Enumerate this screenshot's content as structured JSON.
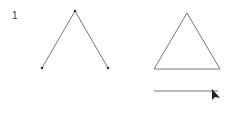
{
  "step_label": "1",
  "colors": {
    "stroke": "#777777",
    "point": "#333333",
    "cursor": "#222222"
  },
  "open_shape": {
    "points": [
      [
        42,
        68
      ],
      [
        75,
        11
      ],
      [
        108,
        68
      ]
    ]
  },
  "triangle": {
    "points": [
      [
        187,
        13
      ],
      [
        220,
        69
      ],
      [
        154,
        69
      ]
    ]
  },
  "line": {
    "x1": 154,
    "y1": 91,
    "x2": 218,
    "y2": 91
  },
  "cursor": {
    "x": 212,
    "y": 89
  }
}
